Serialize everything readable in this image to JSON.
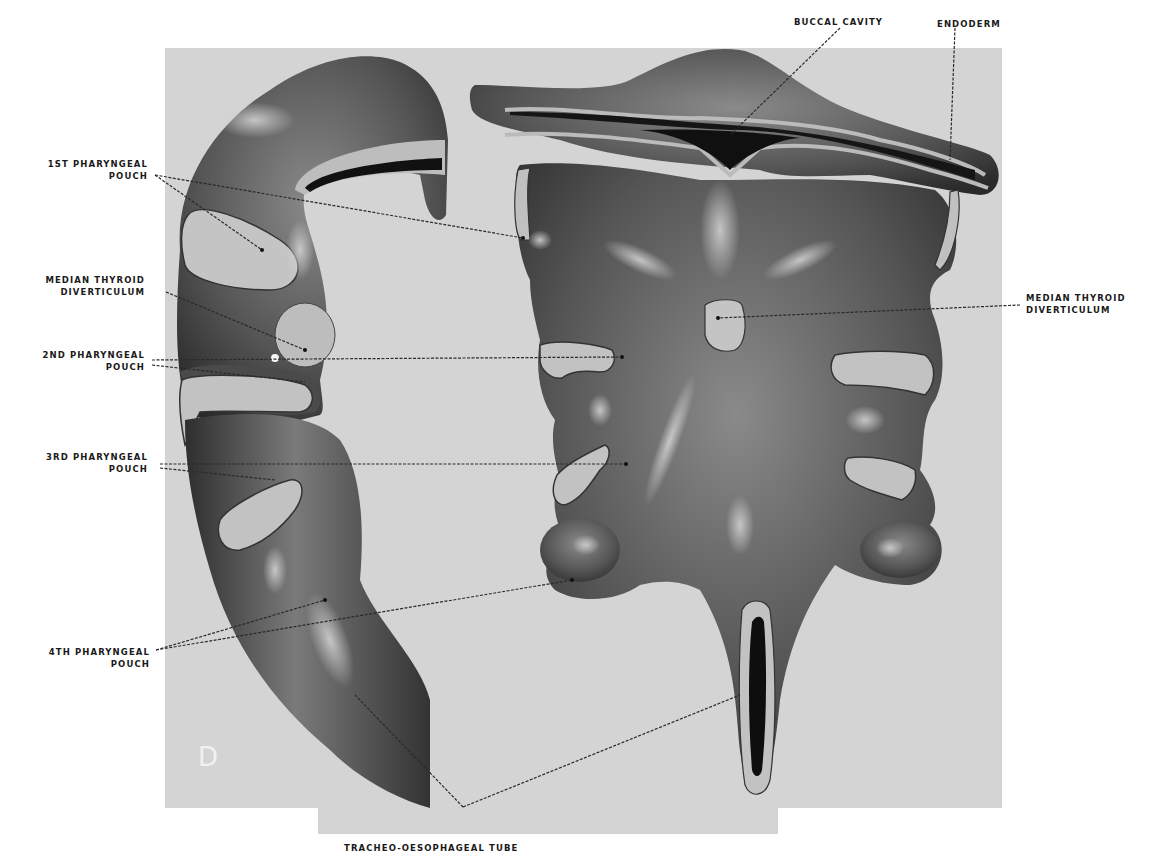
{
  "figure": {
    "panel_letter": "D",
    "background_color": "#d4d4d4",
    "tissue_dark_color": "#3a3a3a",
    "tissue_mid_color": "#6e6e6e",
    "endoderm_cut_color": "#b9b9b9",
    "lumen_color": "#101010"
  },
  "labels": {
    "first_pouch": {
      "line1": "1ST PHARYNGEAL",
      "line2": "POUCH"
    },
    "median_thyroid_left": {
      "line1": "MEDIAN THYROID",
      "line2": "DIVERTICULUM"
    },
    "second_pouch": {
      "line1": "2ND PHARYNGEAL",
      "line2": "POUCH"
    },
    "third_pouch": {
      "line1": "3RD PHARYNGEAL",
      "line2": "POUCH"
    },
    "fourth_pouch": {
      "line1": "4TH PHARYNGEAL",
      "line2": "POUCH"
    },
    "buccal_cavity": "BUCCAL CAVITY",
    "endoderm": "ENDODERM",
    "median_thyroid_right": {
      "line1": "MEDIAN THYROID",
      "line2": "DIVERTICULUM"
    },
    "tracheo_oesophageal_tube": "TRACHEO-OESOPHAGEAL TUBE"
  }
}
